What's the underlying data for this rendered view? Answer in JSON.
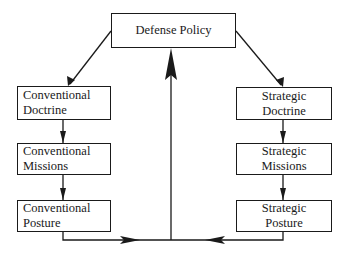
{
  "diagram": {
    "nodes": {
      "defense_policy": {
        "line1": "Defense Policy"
      },
      "conventional_doctrine": {
        "line1": "Conventional",
        "line2": "Doctrine"
      },
      "conventional_missions": {
        "line1": "Conventional",
        "line2": "Missions"
      },
      "conventional_posture": {
        "line1": "Conventional",
        "line2": "Posture"
      },
      "strategic_doctrine": {
        "line1": "Strategic",
        "line2": "Doctrine"
      },
      "strategic_missions": {
        "line1": "Strategic",
        "line2": "Missions"
      },
      "strategic_posture": {
        "line1": "Strategic",
        "line2": "Posture"
      }
    },
    "edges": [
      {
        "from": "Defense Policy",
        "to": "Conventional Doctrine"
      },
      {
        "from": "Defense Policy",
        "to": "Strategic Doctrine"
      },
      {
        "from": "Conventional Doctrine",
        "to": "Conventional Missions"
      },
      {
        "from": "Conventional Missions",
        "to": "Conventional Posture"
      },
      {
        "from": "Strategic Doctrine",
        "to": "Strategic Missions"
      },
      {
        "from": "Strategic Missions",
        "to": "Strategic Posture"
      },
      {
        "from": "Conventional Posture",
        "to": "feedback-junction"
      },
      {
        "from": "Strategic Posture",
        "to": "feedback-junction"
      },
      {
        "from": "feedback-junction",
        "to": "Defense Policy"
      }
    ],
    "colors": {
      "stroke": "#1a1a1a",
      "background": "#ffffff"
    }
  }
}
